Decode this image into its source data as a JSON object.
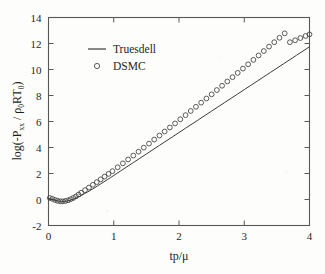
{
  "chart_data": {
    "type": "line",
    "title": "",
    "xlabel": "tp/μ",
    "ylabel": "log(-Pₓₓ / ρ₀RT₀)",
    "ylabel_parts": {
      "prefix": "log(-P",
      "sub1": "xx",
      "mid": " / ρ",
      "sub2": "0",
      "mid2": "RT",
      "sub3": "0",
      "suffix": ")"
    },
    "xlim": [
      0,
      4
    ],
    "ylim": [
      -2,
      14
    ],
    "xticks": [
      0,
      1,
      2,
      3,
      4
    ],
    "yticks": [
      -2,
      0,
      2,
      4,
      6,
      8,
      10,
      12,
      14
    ],
    "xtick_labels": [
      "0",
      "1",
      "2",
      "3",
      "4"
    ],
    "ytick_labels": [
      "-2",
      "0",
      "2",
      "4",
      "6",
      "8",
      "10",
      "12",
      "14"
    ],
    "grid": false,
    "legend_position": "upper-left-inside",
    "series": [
      {
        "name": "Truesdell",
        "style": "line",
        "marker": "none",
        "color": "#3a3a3a",
        "x": [
          0.0,
          0.05,
          0.1,
          0.15,
          0.2,
          0.25,
          0.3,
          0.35,
          0.4,
          0.45,
          0.5,
          0.55,
          0.6,
          0.65,
          0.7,
          0.75,
          0.8,
          0.85,
          0.9,
          0.95,
          1.0,
          1.1,
          1.2,
          1.3,
          1.4,
          1.5,
          1.6,
          1.7,
          1.8,
          1.9,
          2.0,
          2.1,
          2.2,
          2.3,
          2.4,
          2.5,
          2.6,
          2.7,
          2.8,
          2.9,
          3.0,
          3.1,
          3.2,
          3.3,
          3.4,
          3.5,
          3.6,
          3.7,
          3.8,
          3.9,
          4.0
        ],
        "y": [
          0.1,
          0.02,
          -0.06,
          -0.12,
          -0.15,
          -0.14,
          -0.1,
          -0.03,
          0.06,
          0.17,
          0.3,
          0.44,
          0.58,
          0.73,
          0.88,
          1.04,
          1.2,
          1.36,
          1.52,
          1.68,
          1.85,
          2.18,
          2.51,
          2.84,
          3.17,
          3.5,
          3.83,
          4.16,
          4.49,
          4.82,
          5.15,
          5.48,
          5.81,
          6.14,
          6.47,
          6.8,
          7.13,
          7.46,
          7.79,
          8.12,
          8.45,
          8.78,
          9.11,
          9.44,
          9.77,
          10.1,
          10.43,
          10.76,
          11.09,
          11.42,
          11.75
        ]
      },
      {
        "name": "DSMC",
        "style": "markers",
        "marker": "open-circle",
        "color": "#3f3f3f",
        "x": [
          0.02,
          0.06,
          0.1,
          0.14,
          0.18,
          0.22,
          0.26,
          0.3,
          0.34,
          0.38,
          0.42,
          0.46,
          0.5,
          0.56,
          0.62,
          0.68,
          0.74,
          0.8,
          0.86,
          0.92,
          0.98,
          1.06,
          1.14,
          1.22,
          1.3,
          1.38,
          1.46,
          1.54,
          1.62,
          1.7,
          1.78,
          1.86,
          1.94,
          2.02,
          2.1,
          2.18,
          2.26,
          2.34,
          2.42,
          2.5,
          2.58,
          2.66,
          2.74,
          2.82,
          2.9,
          2.98,
          3.06,
          3.14,
          3.22,
          3.3,
          3.38,
          3.46,
          3.54,
          3.62,
          3.7,
          3.78,
          3.86,
          3.94,
          4.0
        ],
        "y": [
          0.12,
          0.05,
          -0.04,
          -0.1,
          -0.14,
          -0.14,
          -0.11,
          -0.06,
          0.02,
          0.12,
          0.24,
          0.38,
          0.52,
          0.72,
          0.92,
          1.13,
          1.34,
          1.55,
          1.76,
          1.97,
          2.18,
          2.48,
          2.78,
          3.08,
          3.38,
          3.68,
          3.99,
          4.3,
          4.61,
          4.92,
          5.23,
          5.54,
          5.85,
          6.17,
          6.49,
          6.81,
          7.13,
          7.45,
          7.77,
          8.09,
          8.42,
          8.75,
          9.08,
          9.41,
          9.74,
          10.07,
          10.4,
          10.74,
          11.08,
          11.42,
          11.76,
          12.1,
          12.44,
          12.78,
          12.1,
          12.25,
          12.42,
          12.58,
          12.7
        ]
      }
    ],
    "legend": [
      {
        "label": "Truesdell",
        "marker": "line"
      },
      {
        "label": "DSMC",
        "marker": "open-circle"
      }
    ]
  }
}
